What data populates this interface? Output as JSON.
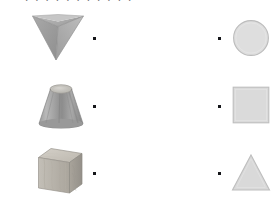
{
  "worksheet": {
    "title_sliver": "- . . . . .  . . . . .  .",
    "background_color": "#ffffff",
    "width": 278,
    "height": 203,
    "dot_color": "#15161a",
    "flat_fill": "#dcdcdc",
    "flat_stroke": "#b8b8b8"
  },
  "left_column": {
    "label": "three-dimensional-solids",
    "items": [
      {
        "name": "inverted-pyramid",
        "shape": "square-pyramid-apex-down",
        "fill_light": "#b5b5b5",
        "fill_mid": "#9a9a9a",
        "fill_dark": "#858585",
        "dot": {
          "x": 93,
          "y": 37
        }
      },
      {
        "name": "truncated-cone-frustum",
        "shape": "conical-frustum",
        "fill_light": "#c2c2c2",
        "fill_mid": "#9d9d9d",
        "fill_dark": "#7e7e7e",
        "dot": {
          "x": 93,
          "y": 105
        }
      },
      {
        "name": "wooden-cube",
        "shape": "cube-isometric",
        "fill_light": "#c9c5bd",
        "fill_mid": "#b2ada4",
        "fill_dark": "#9b968d",
        "dot": {
          "x": 93,
          "y": 172
        }
      }
    ]
  },
  "right_column": {
    "label": "two-dimensional-shapes",
    "items": [
      {
        "name": "circle",
        "shape": "circle",
        "fill": "#dedede",
        "stroke": "#bcbcbc",
        "dot": {
          "x": 218,
          "y": 37
        }
      },
      {
        "name": "square",
        "shape": "square",
        "fill": "#dadada",
        "stroke": "#bdbdbd",
        "dot": {
          "x": 218,
          "y": 105
        }
      },
      {
        "name": "triangle",
        "shape": "triangle",
        "fill": "#d9d9d9",
        "stroke": "#bebebe",
        "dot": {
          "x": 218,
          "y": 172
        }
      }
    ]
  }
}
